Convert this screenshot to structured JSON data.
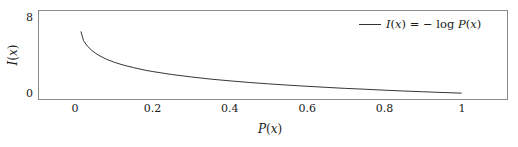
{
  "figure": {
    "background_color": "#ffffff",
    "frame_color": "#8a8a8a",
    "curve_color": "#333333"
  },
  "chart_data": {
    "type": "line",
    "title": "",
    "subtitle": "",
    "xlabel": "P(x)",
    "ylabel": "I(x)",
    "grid": false,
    "legend_position": "upper right",
    "xlim": [
      -0.05,
      1.12
    ],
    "ylim": [
      -0.4,
      9.5
    ],
    "xticks": [
      0,
      0.2,
      0.4,
      0.6,
      0.8,
      1
    ],
    "xtick_labels": [
      "0",
      "0.2",
      "0.4",
      "0.6",
      "0.8",
      "1"
    ],
    "yticks": [
      0,
      8
    ],
    "ytick_labels": [
      "0",
      "8"
    ],
    "series": [
      {
        "name": "I(x) = - log P(x)",
        "legend_label_plain": "I(x) = - log P(x)",
        "formula": "I(x) = -log P(x)",
        "color": "#333333",
        "linewidth": 1,
        "x": [
          0.0135,
          0.02,
          0.03,
          0.04,
          0.05,
          0.06,
          0.08,
          0.1,
          0.12,
          0.15,
          0.18,
          0.2,
          0.25,
          0.3,
          0.35,
          0.4,
          0.45,
          0.5,
          0.55,
          0.6,
          0.65,
          0.7,
          0.75,
          0.8,
          0.85,
          0.9,
          0.95,
          1.0
        ],
        "y": [
          6.6,
          5.64,
          5.06,
          4.65,
          4.32,
          4.06,
          3.64,
          3.32,
          3.06,
          2.74,
          2.47,
          2.32,
          2.0,
          1.74,
          1.51,
          1.32,
          1.15,
          1.0,
          0.86,
          0.74,
          0.62,
          0.51,
          0.42,
          0.32,
          0.23,
          0.15,
          0.07,
          0.0
        ]
      }
    ],
    "legend_entries": [
      {
        "label_parts": {
          "i": "I",
          "open1": "(",
          "x1": "x",
          "close1": ")",
          "equals": " = ",
          "minus": "− ",
          "log": "log",
          "space": " ",
          "p": "P",
          "open2": "(",
          "x2": "x",
          "close2": ")"
        }
      }
    ]
  },
  "labels": {
    "xlabel_parts": {
      "p": "P",
      "open": "(",
      "x": "x",
      "close": ")"
    },
    "ylabel_parts": {
      "i": "I",
      "open": "(",
      "x": "x",
      "close": ")"
    }
  }
}
